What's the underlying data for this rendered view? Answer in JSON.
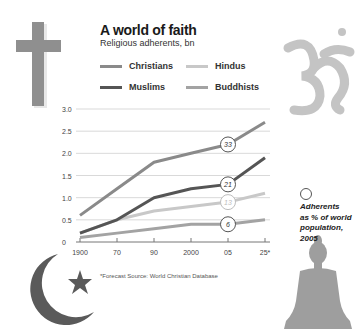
{
  "header": {
    "title": "A world of faith",
    "subtitle": "Religious adherents, bn"
  },
  "legend": [
    {
      "label": "Christians",
      "color": "#8a8a8a"
    },
    {
      "label": "Hindus",
      "color": "#c8c8c8"
    },
    {
      "label": "Muslims",
      "color": "#555555"
    },
    {
      "label": "Buddhists",
      "color": "#a3a3a3"
    }
  ],
  "note": {
    "line1": "Adherents",
    "line2": "as % of world",
    "line3": "population, 2005"
  },
  "footnote": "*Forecast  Source: World Christian Database",
  "icons": [
    "cross-icon",
    "om-icon",
    "crescent-star-icon",
    "buddha-icon"
  ],
  "chart_data": {
    "type": "line",
    "title": "A world of faith",
    "subtitle": "Religious adherents, bn",
    "xlabel": "",
    "ylabel": "Religious adherents, bn",
    "x": [
      "1900",
      "70",
      "90",
      "2000",
      "05",
      "25*"
    ],
    "ylim": [
      0,
      3.0
    ],
    "yticks": [
      "0",
      "0.5",
      "1.0",
      "1.5",
      "2.0",
      "2.5",
      "3.0"
    ],
    "grid": true,
    "legend_position": "top",
    "series": [
      {
        "name": "Christians",
        "color": "#8a8a8a",
        "values": [
          0.6,
          1.2,
          1.8,
          2.0,
          2.2,
          2.7
        ],
        "label_2005": "33"
      },
      {
        "name": "Muslims",
        "color": "#555555",
        "values": [
          0.2,
          0.5,
          1.0,
          1.2,
          1.3,
          1.9
        ],
        "label_2005": "21"
      },
      {
        "name": "Hindus",
        "color": "#c8c8c8",
        "values": [
          0.2,
          0.5,
          0.7,
          0.8,
          0.9,
          1.1
        ],
        "label_2005": "13"
      },
      {
        "name": "Buddhists",
        "color": "#a3a3a3",
        "values": [
          0.1,
          0.2,
          0.3,
          0.4,
          0.4,
          0.5
        ],
        "label_2005": "6"
      }
    ],
    "annotations": [
      "Adherents as % of world population, 2005",
      "*Forecast",
      "Source: World Christian Database"
    ]
  }
}
